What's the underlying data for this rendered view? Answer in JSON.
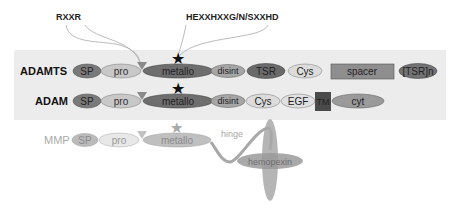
{
  "annotations": {
    "rxxr": "RXXR",
    "zinc_motif": "HEXXHXXG/N/SXXHD"
  },
  "rows": {
    "adamts": {
      "name": "ADAMTS",
      "domains": [
        "SP",
        "pro",
        "metallo",
        "disint",
        "TSR",
        "Cys",
        "spacer",
        "[TSR]n"
      ]
    },
    "adam": {
      "name": "ADAM",
      "domains": [
        "SP",
        "pro",
        "metallo",
        "disint",
        "Cys",
        "EGF",
        "TM",
        "cyt"
      ]
    },
    "mmp": {
      "name": "MMP",
      "domains": [
        "SP",
        "pro",
        "metallo",
        "hinge",
        "hemopexin"
      ]
    }
  },
  "colors": {
    "band": "#ebebeb",
    "sp": "#7a7a7a",
    "pro": "#c8c8c8",
    "metallo": "#6e6e6e",
    "disint": "#a6a6a6",
    "tsr": "#6a6a6a",
    "cys": "#dcdcdc",
    "spacer": "#8e8e8e",
    "tsrn": "#737373",
    "egf": "#e0e0e0",
    "tm": "#4a4a4a",
    "cyt": "#9a9a9a",
    "cleavage": "#8a8a8a",
    "star": "#111111",
    "mmp_faded": "#b0b0b0"
  }
}
